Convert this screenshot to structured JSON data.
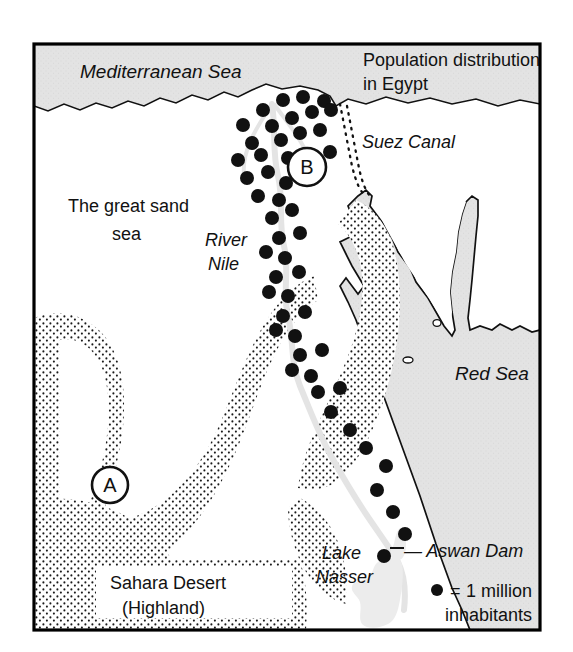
{
  "map": {
    "title_line1": "Population distribution",
    "title_line2": "in Egypt",
    "labels": {
      "mediterranean_sea": "Mediterranean Sea",
      "suez_canal": "Suez Canal",
      "red_sea": "Red Sea",
      "great_sand_sea_line1": "The great sand",
      "great_sand_sea_line2": "sea",
      "river_nile_line1": "River",
      "river_nile_line2": "Nile",
      "sahara_desert_line1": "Sahara Desert",
      "sahara_desert_line2": "(Highland)",
      "lake_nasser_line1": "Lake",
      "lake_nasser_line2": "Nasser",
      "aswan_dam": "— Aswan Dam"
    },
    "markers": [
      {
        "id": "marker-a",
        "label": "A",
        "cx": 110,
        "cy": 485,
        "r": 18
      },
      {
        "id": "marker-b",
        "label": "B",
        "cx": 307,
        "cy": 167,
        "r": 19
      }
    ],
    "legend": {
      "symbol": "●",
      "equals": "=",
      "line1": "1 million",
      "line2": "inhabitants"
    },
    "colors": {
      "ink": "#111111",
      "sea_fill": "#e3e3e3",
      "land_fill": "#ffffff",
      "nile_fill": "#e8e8e8",
      "stipple_dot": "#1a1a1a",
      "frame": "#000000",
      "page_background": "#ffffff"
    },
    "population_dots": [
      [
        243,
        125
      ],
      [
        263,
        110
      ],
      [
        283,
        100
      ],
      [
        303,
        97
      ],
      [
        324,
        101
      ],
      [
        252,
        143
      ],
      [
        272,
        126
      ],
      [
        292,
        118
      ],
      [
        312,
        112
      ],
      [
        331,
        110
      ],
      [
        238,
        160
      ],
      [
        261,
        155
      ],
      [
        281,
        140
      ],
      [
        300,
        133
      ],
      [
        320,
        130
      ],
      [
        247,
        178
      ],
      [
        268,
        172
      ],
      [
        288,
        158
      ],
      [
        286,
        183
      ],
      [
        330,
        152
      ],
      [
        258,
        196
      ],
      [
        279,
        200
      ],
      [
        272,
        218
      ],
      [
        292,
        210
      ],
      [
        279,
        238
      ],
      [
        300,
        233
      ],
      [
        285,
        258
      ],
      [
        266,
        252
      ],
      [
        276,
        277
      ],
      [
        299,
        272
      ],
      [
        288,
        296
      ],
      [
        269,
        292
      ],
      [
        283,
        316
      ],
      [
        305,
        312
      ],
      [
        295,
        336
      ],
      [
        276,
        330
      ],
      [
        300,
        355
      ],
      [
        322,
        350
      ],
      [
        311,
        376
      ],
      [
        292,
        370
      ],
      [
        318,
        392
      ],
      [
        340,
        388
      ],
      [
        331,
        412
      ],
      [
        350,
        430
      ],
      [
        366,
        448
      ],
      [
        386,
        466
      ],
      [
        377,
        490
      ],
      [
        393,
        512
      ],
      [
        405,
        534
      ],
      [
        384,
        556
      ]
    ],
    "dot_radius": 7
  }
}
